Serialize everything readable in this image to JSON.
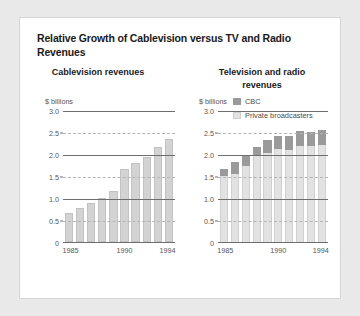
{
  "figure": {
    "title": "Relative Growth of Cablevision versus TV and Radio Revenues",
    "background_color": "#e9e9e9",
    "panel_color": "#ffffff",
    "border_color": "#d5d5d5"
  },
  "colors": {
    "cbc": "#9a9a9a",
    "private_broadcasters": "#e2e2e2",
    "cablevision_bar": "#d3d3d3",
    "gridline_major": "#6e6e6e",
    "gridline_minor": "#b4b4b4",
    "text": "#1a1a1a",
    "axis_text": "#555555"
  },
  "legend": {
    "position": "top-right",
    "entries": [
      {
        "label": "CBC",
        "swatch": "cbc"
      },
      {
        "label": "Private broadcasters",
        "swatch": "private_broadcasters"
      }
    ]
  },
  "chart_data": [
    {
      "type": "bar",
      "title": "Cablevision revenues",
      "ylabel": "$ billions",
      "xlabel": "",
      "ylim": [
        0,
        3.0
      ],
      "ytick_labels": [
        "3.0",
        "2.5",
        "2.0",
        "1.5",
        "1.0",
        "0.5",
        "0"
      ],
      "ytick_values": [
        3.0,
        2.5,
        2.0,
        1.5,
        1.0,
        0.5,
        0
      ],
      "grid": true,
      "x": [
        1985,
        1986,
        1987,
        1988,
        1989,
        1990,
        1991,
        1992,
        1993,
        1994
      ],
      "xtick_labels": [
        "1985",
        "1990",
        "1994"
      ],
      "xtick_values": [
        1985,
        1990,
        1994
      ],
      "categories": [
        "1985",
        "1986",
        "1987",
        "1988",
        "1989",
        "1990",
        "1991",
        "1992",
        "1993",
        "1994"
      ],
      "values": [
        0.67,
        0.77,
        0.88,
        1.0,
        1.15,
        1.65,
        1.8,
        1.93,
        2.15,
        2.33
      ]
    },
    {
      "type": "bar",
      "subtype": "stacked",
      "title": "Television and radio revenues",
      "ylabel": "$ billions",
      "xlabel": "",
      "ylim": [
        0,
        3.0
      ],
      "ytick_labels": [
        "3.0",
        "2.5",
        "2.0",
        "1.5",
        "1.0",
        "0.5",
        "0"
      ],
      "ytick_values": [
        3.0,
        2.5,
        2.0,
        1.5,
        1.0,
        0.5,
        0
      ],
      "grid": true,
      "x": [
        1985,
        1986,
        1987,
        1988,
        1989,
        1990,
        1991,
        1992,
        1993,
        1994
      ],
      "xtick_labels": [
        "1985",
        "1990",
        "1994"
      ],
      "xtick_values": [
        1985,
        1990,
        1994
      ],
      "categories": [
        "1985",
        "1986",
        "1987",
        "1988",
        "1989",
        "1990",
        "1991",
        "1992",
        "1993",
        "1994"
      ],
      "series": [
        {
          "name": "Private broadcasters",
          "values": [
            1.5,
            1.55,
            1.72,
            1.95,
            2.02,
            2.12,
            2.1,
            2.18,
            2.18,
            2.2
          ]
        },
        {
          "name": "CBC",
          "values": [
            0.17,
            0.28,
            0.25,
            0.22,
            0.31,
            0.28,
            0.3,
            0.35,
            0.32,
            0.35
          ]
        }
      ],
      "totals": [
        1.67,
        1.83,
        1.97,
        2.17,
        2.33,
        2.4,
        2.4,
        2.53,
        2.5,
        2.55
      ]
    }
  ]
}
